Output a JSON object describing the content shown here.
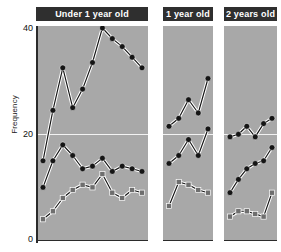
{
  "chart_data": {
    "type": "line",
    "title": "",
    "xlabel": "",
    "ylabel": "Frequency",
    "ylim": [
      0,
      42
    ],
    "yticks": [
      0,
      20,
      40
    ],
    "grid": "single horizontal white gridline at y=20",
    "legend": "none",
    "marker_shapes": {
      "upper": "circle",
      "middle": "circle",
      "lower": "square"
    },
    "colors": {
      "panel_background": "#a8a8a8",
      "header_background": "#2f2f2f",
      "header_text": "#ffffff",
      "circle_marker": "#151515",
      "square_marker": "#6e6e6e",
      "line_halo": "#ffffff",
      "line_main": "#151515",
      "gridline": "#f2f2f2",
      "axis": "#2b2b2b"
    },
    "panels": [
      {
        "label": "Under 1 year old",
        "n_points": 11,
        "x": [
          1,
          2,
          3,
          4,
          5,
          6,
          7,
          8,
          9,
          10,
          11
        ],
        "series": [
          {
            "name": "upper",
            "marker": "circle",
            "values": [
              15.0,
              24.5,
              32.5,
              25.0,
              28.5,
              33.5,
              40.0,
              38.0,
              36.5,
              34.5,
              32.5
            ]
          },
          {
            "name": "middle",
            "marker": "circle",
            "values": [
              10.0,
              15.0,
              18.0,
              16.0,
              13.5,
              14.0,
              15.5,
              13.0,
              14.0,
              13.5,
              13.0
            ]
          },
          {
            "name": "lower",
            "marker": "square",
            "values": [
              4.0,
              5.5,
              8.0,
              9.5,
              10.5,
              10.0,
              12.5,
              9.0,
              8.0,
              9.5,
              9.0
            ]
          }
        ]
      },
      {
        "label": "1 year old",
        "n_points": 5,
        "x": [
          1,
          2,
          3,
          4,
          5
        ],
        "series": [
          {
            "name": "upper",
            "marker": "circle",
            "values": [
              21.5,
              23.0,
              26.5,
              24.0,
              30.5
            ]
          },
          {
            "name": "middle",
            "marker": "circle",
            "values": [
              14.5,
              16.0,
              19.0,
              16.0,
              21.0
            ]
          },
          {
            "name": "lower",
            "marker": "square",
            "values": [
              6.5,
              11.0,
              10.5,
              9.5,
              9.0
            ]
          }
        ]
      },
      {
        "label": "2 years old",
        "n_points": 6,
        "x": [
          1,
          2,
          3,
          4,
          5,
          6
        ],
        "series": [
          {
            "name": "upper",
            "marker": "circle",
            "values": [
              19.5,
              20.0,
              21.5,
              19.5,
              22.0,
              23.0
            ]
          },
          {
            "name": "middle",
            "marker": "circle",
            "values": [
              9.0,
              11.5,
              13.5,
              14.5,
              15.0,
              17.5
            ]
          },
          {
            "name": "lower",
            "marker": "square",
            "values": [
              4.5,
              5.5,
              5.5,
              5.0,
              4.5,
              9.0
            ]
          }
        ]
      }
    ]
  },
  "axis": {
    "ylabel": "Frequency",
    "tick_40": "40",
    "tick_20": "20",
    "tick_0": "0"
  },
  "panels": {
    "p0_label": "Under 1 year old",
    "p1_label": "1 year old",
    "p2_label": "2 years old"
  }
}
